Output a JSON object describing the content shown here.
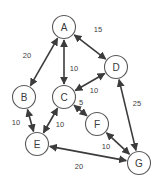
{
  "diagram": {
    "type": "node-link-graph",
    "background_color": "#ffffff",
    "node_fill": "#ffffff",
    "node_stroke": "#5a5a5a",
    "edge_color": "#3c3c3c",
    "label_color": "#3a3a3a",
    "nodes": [
      {
        "id": "A",
        "label": "A",
        "cx": 64,
        "cy": 27,
        "r": 11.5
      },
      {
        "id": "B",
        "label": "B",
        "cx": 24,
        "cy": 97,
        "r": 11.5
      },
      {
        "id": "C",
        "label": "C",
        "cx": 64,
        "cy": 97,
        "r": 11.5
      },
      {
        "id": "D",
        "label": "D",
        "cx": 116,
        "cy": 67,
        "r": 11.5
      },
      {
        "id": "E",
        "label": "E",
        "cx": 37,
        "cy": 144,
        "r": 11.5
      },
      {
        "id": "F",
        "label": "F",
        "cx": 97,
        "cy": 124,
        "r": 11.5
      },
      {
        "id": "G",
        "label": "G",
        "cx": 139,
        "cy": 163,
        "r": 11.5
      }
    ],
    "edges": [
      {
        "id": "A-B",
        "from": "A",
        "to": "B",
        "weight": "20",
        "label_x": 27,
        "label_y": 55,
        "arrows": "both"
      },
      {
        "id": "A-C",
        "from": "A",
        "to": "C",
        "weight": "10",
        "label_x": 74,
        "label_y": 68,
        "arrows": "both"
      },
      {
        "id": "A-D",
        "from": "A",
        "to": "D",
        "weight": "15",
        "label_x": 98,
        "label_y": 29,
        "arrows": "both"
      },
      {
        "id": "C-D",
        "from": "C",
        "to": "D",
        "weight": "10",
        "label_x": 94,
        "label_y": 90,
        "arrows": "both"
      },
      {
        "id": "C-F",
        "from": "C",
        "to": "F",
        "weight": "5",
        "label_x": 81,
        "label_y": 102,
        "arrows": "both"
      },
      {
        "id": "B-E",
        "from": "B",
        "to": "E",
        "weight": "10",
        "label_x": 16,
        "label_y": 122,
        "arrows": "both"
      },
      {
        "id": "C-E",
        "from": "C",
        "to": "E",
        "weight": "10",
        "label_x": 60,
        "label_y": 124,
        "arrows": "both"
      },
      {
        "id": "D-G",
        "from": "D",
        "to": "G",
        "weight": "25",
        "label_x": 137,
        "label_y": 103,
        "arrows": "both"
      },
      {
        "id": "F-G",
        "from": "F",
        "to": "G",
        "weight": "10",
        "label_x": 106,
        "label_y": 146,
        "arrows": "both"
      },
      {
        "id": "E-G",
        "from": "E",
        "to": "G",
        "weight": "20",
        "label_x": 79,
        "label_y": 166,
        "arrows": "both"
      }
    ]
  }
}
